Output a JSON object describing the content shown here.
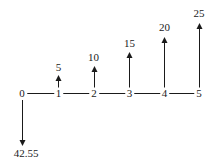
{
  "diagram": {
    "kind": "cash-flow-diagram",
    "background_color": "#ffffff",
    "line_color": "#1a1a1a"
  },
  "timeline": {
    "ticks": [
      "0",
      "1",
      "2",
      "3",
      "4",
      "5"
    ]
  },
  "cashflows": {
    "inflows": [
      {
        "period": 1,
        "value": "5",
        "direction": "up"
      },
      {
        "period": 2,
        "value": "10",
        "direction": "up"
      },
      {
        "period": 3,
        "value": "15",
        "direction": "up"
      },
      {
        "period": 4,
        "value": "20",
        "direction": "up"
      },
      {
        "period": 5,
        "value": "25",
        "direction": "up"
      }
    ],
    "outflow": {
      "period": 0,
      "value": "42.55",
      "direction": "down"
    }
  }
}
